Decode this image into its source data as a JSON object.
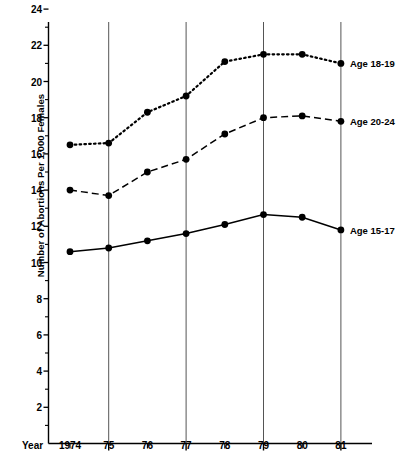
{
  "chart_data": {
    "type": "line",
    "title": "",
    "xlabel": "Year",
    "ylabel": "Number of Abortions Per 1,000 Females",
    "categories": [
      "1974",
      "75",
      "76",
      "77",
      "78",
      "79",
      "80",
      "81"
    ],
    "x": [
      1974,
      1975,
      1976,
      1977,
      1978,
      1979,
      1980,
      1981
    ],
    "xlim": [
      1973.6,
      1981.7
    ],
    "ylim": [
      0,
      25
    ],
    "yticks": [
      2,
      4,
      6,
      8,
      10,
      12,
      14,
      16,
      18,
      20,
      22,
      24
    ],
    "ytick_labels": [
      "2",
      "4",
      "6",
      "8",
      "10",
      "12",
      "14",
      "16",
      "18",
      "20",
      "22",
      "24"
    ],
    "y_minor_ticks": [
      1,
      3,
      5,
      7,
      9,
      11,
      13,
      15,
      17,
      19,
      21,
      23,
      25
    ],
    "grid": "vertical gridlines at 1975, 1977, 1979, 1981",
    "gridline_years": [
      1975,
      1977,
      1979,
      1981
    ],
    "legend_position": "right-of-series-end",
    "series": [
      {
        "name": "Age 18-19",
        "label": "Age 18-19",
        "style": "dotted",
        "marker": "filled-circle",
        "color": "#000000",
        "values": [
          16.5,
          16.6,
          18.3,
          19.2,
          21.1,
          21.5,
          21.5,
          21.0
        ]
      },
      {
        "name": "Age 20-24",
        "label": "Age 20-24",
        "style": "dashed",
        "marker": "filled-circle",
        "color": "#000000",
        "values": [
          14.0,
          13.7,
          15.0,
          15.7,
          17.1,
          18.0,
          18.1,
          17.8
        ]
      },
      {
        "name": "Age 15-17",
        "label": "Age 15-17",
        "style": "solid",
        "marker": "filled-circle",
        "color": "#000000",
        "values": [
          10.6,
          10.8,
          11.2,
          11.6,
          12.1,
          12.65,
          12.5,
          11.8
        ]
      }
    ]
  },
  "axis": {
    "year_word": "Year",
    "y_title": "Number of Abortions Per 1,000 Females"
  },
  "colors": {
    "ink": "#000000",
    "gridline": "#555555",
    "background": "#ffffff"
  }
}
